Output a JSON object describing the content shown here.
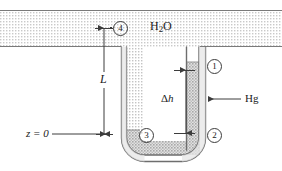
{
  "figure": {
    "type": "physics-diagram"
  },
  "labels": {
    "water": "H",
    "water_sub": "2",
    "water_tail": "O",
    "water_full": "H2O",
    "mercury": "Hg",
    "length": "L",
    "delta_h_symbol": "Δ",
    "delta_h_var": "h",
    "datum": "z = 0",
    "point_1": "1",
    "point_2": "2",
    "point_3": "3",
    "point_4": "4"
  },
  "colors": {
    "line": "#3c3c3c",
    "text": "#1a1a1a",
    "water_fill": "#d8d8d8",
    "mercury_fill": "#b4b4b4",
    "tube_wall": "#6e6e6e",
    "background": "#ffffff"
  },
  "geometry": {
    "water_band_top": 10,
    "water_band_bottom": 47,
    "mercury_level_right": 62,
    "mercury_level_left": 130,
    "datum_y": 134,
    "surface_y": 28
  },
  "annotations": {
    "delta_h_top_y": 70,
    "delta_h_bottom_y": 133,
    "length_top_y": 28,
    "length_bottom_y": 134
  }
}
